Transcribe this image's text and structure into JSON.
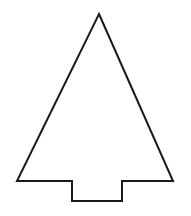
{
  "figure": {
    "background": "#ffffff",
    "stroke": "#1a1a1a",
    "stroke_width": 2,
    "shape": {
      "name": "tree-outline",
      "points": [
        [
          99,
          14
        ],
        [
          173,
          181
        ],
        [
          122,
          181
        ],
        [
          122,
          201
        ],
        [
          72,
          201
        ],
        [
          72,
          181
        ],
        [
          17,
          181
        ]
      ]
    }
  }
}
